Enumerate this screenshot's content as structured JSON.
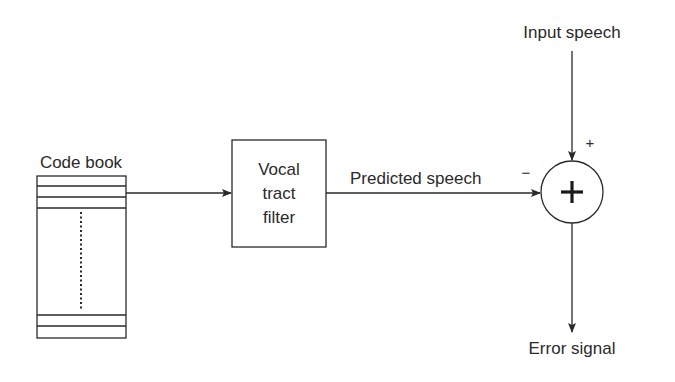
{
  "diagram": {
    "codebook": {
      "label": "Code book"
    },
    "filter": {
      "line1": "Vocal",
      "line2": "tract",
      "line3": "filter"
    },
    "predicted_label": "Predicted speech",
    "input_label": "Input speech",
    "output_label": "Error signal",
    "summer": {
      "symbol": "+",
      "plus_sign": "+",
      "minus_sign": "−"
    }
  }
}
